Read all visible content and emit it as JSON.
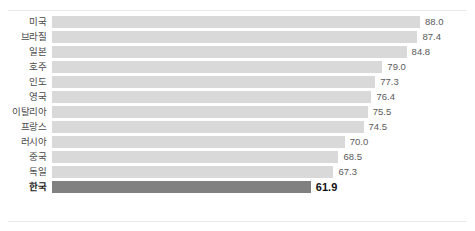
{
  "chart_data": {
    "type": "bar",
    "orientation": "horizontal",
    "title": "",
    "subtitle": "",
    "xlabel": "",
    "ylabel": "",
    "grid": false,
    "legend": null,
    "value_format": "one-decimal",
    "xlim": [
      0,
      88.0
    ],
    "categories": [
      "미국",
      "브라질",
      "일본",
      "호주",
      "인도",
      "영국",
      "이탈리아",
      "프랑스",
      "러시아",
      "중국",
      "독일",
      "한국"
    ],
    "values": [
      88.0,
      87.4,
      84.8,
      79.0,
      77.3,
      76.4,
      75.5,
      74.5,
      70.0,
      68.5,
      67.3,
      61.9
    ],
    "value_labels": [
      "88.0",
      "87.4",
      "84.8",
      "79.0",
      "77.3",
      "76.4",
      "75.5",
      "74.5",
      "70.0",
      "68.5",
      "67.3",
      "61.9"
    ],
    "highlight_category": "한국",
    "colors": {
      "bar": "#d9d9d9",
      "bar_highlight": "#808080",
      "label": "#4a4a4a",
      "label_highlight": "#1a1a1a",
      "value": "#5a5a5a",
      "value_highlight": "#111111",
      "rule": "#e9e9e9",
      "background": "#ffffff"
    },
    "rows": [
      {
        "label": "미국",
        "value": 88.0,
        "value_label": "88.0",
        "highlight": false
      },
      {
        "label": "브라질",
        "value": 87.4,
        "value_label": "87.4",
        "highlight": false
      },
      {
        "label": "일본",
        "value": 84.8,
        "value_label": "84.8",
        "highlight": false
      },
      {
        "label": "호주",
        "value": 79.0,
        "value_label": "79.0",
        "highlight": false
      },
      {
        "label": "인도",
        "value": 77.3,
        "value_label": "77.3",
        "highlight": false
      },
      {
        "label": "영국",
        "value": 76.4,
        "value_label": "76.4",
        "highlight": false
      },
      {
        "label": "이탈리아",
        "value": 75.5,
        "value_label": "75.5",
        "highlight": false
      },
      {
        "label": "프랑스",
        "value": 74.5,
        "value_label": "74.5",
        "highlight": false
      },
      {
        "label": "러시아",
        "value": 70.0,
        "value_label": "70.0",
        "highlight": false
      },
      {
        "label": "중국",
        "value": 68.5,
        "value_label": "68.5",
        "highlight": false
      },
      {
        "label": "독일",
        "value": 67.3,
        "value_label": "67.3",
        "highlight": false
      },
      {
        "label": "한국",
        "value": 61.9,
        "value_label": "61.9",
        "highlight": true
      }
    ]
  }
}
